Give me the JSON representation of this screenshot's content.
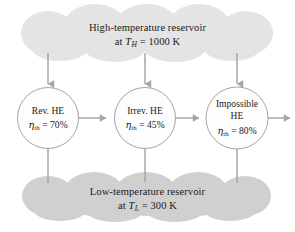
{
  "diagram": {
    "background_color": "#ffffff",
    "stroke_color": "#8c8c8c",
    "text_color": "#1a1a1a"
  },
  "reservoirs": {
    "hot": {
      "name": "high-temperature-reservoir",
      "line1": "High-temperature reservoir",
      "prefix": "at",
      "symbol": "T",
      "subscript": "H",
      "equals": "=",
      "value": "1000",
      "unit": "K",
      "fill_color": "#e3e3e3"
    },
    "cold": {
      "name": "low-temperature-reservoir",
      "line1": "Low-temperature reservoir",
      "prefix": "at",
      "symbol": "T",
      "subscript": "L",
      "equals": "=",
      "value": "300",
      "unit": "K",
      "fill_color": "#cfcfcf"
    }
  },
  "engines": [
    {
      "id": "rev-he",
      "name_line1": "Rev. HE",
      "name_line2": "",
      "eta_symbol": "η",
      "eta_subscript": "th",
      "equals": "=",
      "efficiency": "70%",
      "fill_color": "#fcfcfc"
    },
    {
      "id": "irrev-he",
      "name_line1": "Irrev. HE",
      "name_line2": "",
      "eta_symbol": "η",
      "eta_subscript": "th",
      "equals": "=",
      "efficiency": "45%",
      "fill_color": "#fcfcfc"
    },
    {
      "id": "impossible-he",
      "name_line1": "Impossible",
      "name_line2": "HE",
      "eta_symbol": "η",
      "eta_subscript": "th",
      "equals": "=",
      "efficiency": "80%",
      "fill_color": "#fcfcfc"
    }
  ],
  "arrows": {
    "heat_in_label": "",
    "work_out_label": "",
    "heat_out_label": ""
  }
}
